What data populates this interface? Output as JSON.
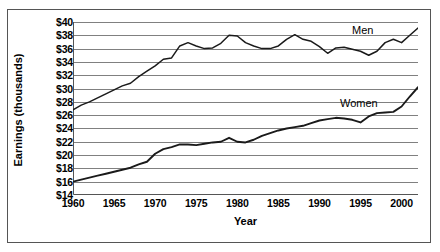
{
  "chart_data": {
    "type": "line",
    "title": "",
    "xlabel": "Year",
    "ylabel": "Earnings (thousands)",
    "xlim": [
      1960,
      2002
    ],
    "ylim": [
      14,
      40
    ],
    "xticks": [
      1960,
      1965,
      1970,
      1975,
      1980,
      1985,
      1990,
      1995,
      2000
    ],
    "xtick_labels": [
      "1960",
      "1965",
      "1970",
      "1975",
      "1980",
      "1985",
      "1990",
      "1995",
      "2000"
    ],
    "yticks": [
      14,
      16,
      18,
      20,
      22,
      24,
      26,
      28,
      30,
      32,
      34,
      36,
      38,
      40
    ],
    "ytick_labels": [
      "$14",
      "$16",
      "$18",
      "$20",
      "$22",
      "$24",
      "$26",
      "$28",
      "$30",
      "$32",
      "$34",
      "$36",
      "$38",
      "$40"
    ],
    "grid": true,
    "grid_axis": "y",
    "legend_position": "inline-right",
    "line_color": "#1a1a1a",
    "grid_color": "#808080",
    "axis_color": "#555555",
    "background_color": "#ffffff",
    "x": [
      1960,
      1961,
      1962,
      1963,
      1964,
      1965,
      1966,
      1967,
      1968,
      1969,
      1970,
      1971,
      1972,
      1973,
      1974,
      1975,
      1976,
      1977,
      1978,
      1979,
      1980,
      1981,
      1982,
      1983,
      1984,
      1985,
      1986,
      1987,
      1988,
      1989,
      1990,
      1991,
      1992,
      1993,
      1994,
      1995,
      1996,
      1997,
      1998,
      1999,
      2000,
      2001,
      2002
    ],
    "series": [
      {
        "name": "Men",
        "label": "Men",
        "values": [
          26.8,
          27.5,
          28.0,
          28.6,
          29.2,
          29.8,
          30.4,
          30.8,
          31.8,
          32.6,
          33.4,
          34.4,
          34.6,
          36.4,
          36.9,
          36.4,
          36.0,
          36.1,
          36.8,
          38.0,
          37.9,
          36.9,
          36.4,
          36.0,
          36.0,
          36.4,
          37.4,
          38.1,
          37.4,
          37.1,
          36.3,
          35.3,
          36.1,
          36.2,
          35.9,
          35.6,
          35.0,
          35.6,
          36.9,
          37.4,
          36.9,
          38.0,
          39.1
        ]
      },
      {
        "name": "Women",
        "label": "Women",
        "values": [
          16.0,
          16.3,
          16.6,
          16.9,
          17.2,
          17.5,
          17.8,
          18.1,
          18.6,
          19.0,
          20.2,
          20.9,
          21.2,
          21.6,
          21.6,
          21.5,
          21.7,
          21.9,
          22.0,
          22.6,
          22.0,
          21.9,
          22.3,
          22.9,
          23.3,
          23.7,
          24.0,
          24.2,
          24.4,
          24.8,
          25.2,
          25.4,
          25.6,
          25.5,
          25.3,
          24.9,
          25.8,
          26.3,
          26.4,
          26.5,
          27.3,
          28.8,
          30.2
        ]
      }
    ]
  }
}
